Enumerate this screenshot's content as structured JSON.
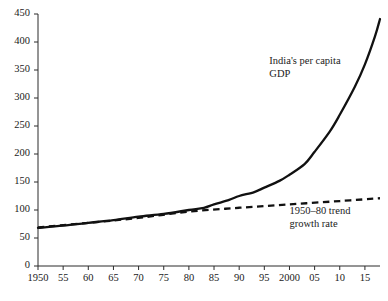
{
  "chart_data": {
    "type": "line",
    "title": "",
    "subtitle": "",
    "xlabel": "",
    "ylabel": "",
    "xlim": [
      1950,
      2018
    ],
    "ylim": [
      0,
      450
    ],
    "grid": false,
    "legend_position": "inline-annotations",
    "x_tick_labels": [
      "1950",
      "55",
      "60",
      "65",
      "70",
      "75",
      "80",
      "85",
      "90",
      "95",
      "2000",
      "05",
      "10",
      "15"
    ],
    "x_tick_values": [
      1950,
      1955,
      1960,
      1965,
      1970,
      1975,
      1980,
      1985,
      1990,
      1995,
      2000,
      2005,
      2010,
      2015
    ],
    "y_tick_labels": [
      "0",
      "50",
      "100",
      "150",
      "200",
      "250",
      "300",
      "350",
      "400",
      "450"
    ],
    "y_tick_values": [
      0,
      50,
      100,
      150,
      200,
      250,
      300,
      350,
      400,
      450
    ],
    "annotations": [
      {
        "text_line1": "India's per capita",
        "text_line2": "GDP",
        "x": 1996,
        "y": 360
      },
      {
        "text_line1": "1950–80 trend",
        "text_line2": "growth rate",
        "x": 2000,
        "y": 92
      }
    ],
    "series": [
      {
        "name": "India's per capita GDP",
        "style": "solid",
        "color": "#111111",
        "x": [
          1950,
          1955,
          1960,
          1965,
          1970,
          1975,
          1980,
          1983,
          1985,
          1988,
          1990,
          1993,
          1995,
          1998,
          2000,
          2003,
          2005,
          2008,
          2010,
          2013,
          2015,
          2017,
          2018
        ],
        "values": [
          68,
          72,
          77,
          82,
          88,
          93,
          100,
          104,
          110,
          118,
          125,
          132,
          140,
          152,
          163,
          182,
          204,
          240,
          270,
          320,
          360,
          410,
          441
        ]
      },
      {
        "name": "1950–80 trend growth rate",
        "style": "dashed",
        "color": "#111111",
        "x": [
          1950,
          1960,
          1970,
          1980,
          1990,
          2000,
          2010,
          2018
        ],
        "values": [
          69,
          77,
          86,
          97,
          104,
          110,
          116,
          121
        ]
      }
    ]
  },
  "axis": {
    "y_axis_name": "y-axis",
    "x_axis_name": "x-axis"
  }
}
